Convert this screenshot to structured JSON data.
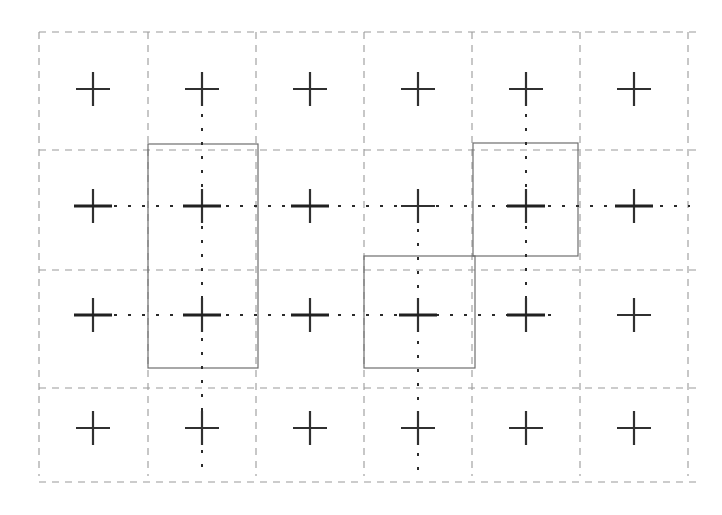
{
  "figure": {
    "title": "",
    "caption": "",
    "width": 722,
    "height": 515,
    "background_color": "#ffffff"
  },
  "chart_data": {
    "type": "scatter",
    "title": "",
    "subtitle": "",
    "xlabel": "",
    "ylabel": "",
    "xlim": [
      0,
      722
    ],
    "ylim": [
      0,
      515
    ],
    "grid": true,
    "legend": null,
    "colors": {
      "cross": "#303030",
      "dashed_grid": "#9a9a9a",
      "solid_rect": "#6e6e6e",
      "dotted_line": "#2b2b2b",
      "background": "#ffffff"
    },
    "grid_columns": 6,
    "grid_rows": 4,
    "dashed_grid": {
      "stroke": "#9a9a9a",
      "stroke_width": 1.1,
      "dash_pattern": "7 6",
      "vertical_x": [
        39,
        148,
        256,
        364,
        472,
        580,
        688
      ],
      "vertical_y_range": [
        32,
        476
      ],
      "horizontal_y": [
        32,
        150,
        270,
        388,
        482
      ],
      "horizontal_x_range": [
        39,
        696
      ]
    },
    "cross_markers": {
      "stroke": "#303030",
      "stroke_width": 2.2,
      "arm_half_length": 17,
      "columns_x": [
        93,
        202,
        310,
        418,
        526,
        634
      ],
      "rows_y": [
        89,
        206,
        315,
        428
      ],
      "points": [
        {
          "id": "c1r1",
          "x": 93,
          "y": 89
        },
        {
          "id": "c2r1",
          "x": 202,
          "y": 89
        },
        {
          "id": "c3r1",
          "x": 310,
          "y": 89
        },
        {
          "id": "c4r1",
          "x": 418,
          "y": 89
        },
        {
          "id": "c5r1",
          "x": 526,
          "y": 89
        },
        {
          "id": "c6r1",
          "x": 634,
          "y": 89
        },
        {
          "id": "c1r2",
          "x": 93,
          "y": 206
        },
        {
          "id": "c2r2",
          "x": 202,
          "y": 206
        },
        {
          "id": "c3r2",
          "x": 310,
          "y": 206
        },
        {
          "id": "c4r2",
          "x": 418,
          "y": 206
        },
        {
          "id": "c5r2",
          "x": 526,
          "y": 206
        },
        {
          "id": "c6r2",
          "x": 634,
          "y": 206
        },
        {
          "id": "c1r3",
          "x": 93,
          "y": 315
        },
        {
          "id": "c2r3",
          "x": 202,
          "y": 315
        },
        {
          "id": "c3r3",
          "x": 310,
          "y": 315
        },
        {
          "id": "c4r3",
          "x": 418,
          "y": 315
        },
        {
          "id": "c5r3",
          "x": 526,
          "y": 315
        },
        {
          "id": "c6r3",
          "x": 634,
          "y": 315
        },
        {
          "id": "c1r4",
          "x": 93,
          "y": 428
        },
        {
          "id": "c2r4",
          "x": 202,
          "y": 428
        },
        {
          "id": "c3r4",
          "x": 310,
          "y": 428
        },
        {
          "id": "c4r4",
          "x": 418,
          "y": 428
        },
        {
          "id": "c5r4",
          "x": 526,
          "y": 428
        },
        {
          "id": "c6r4",
          "x": 634,
          "y": 428
        }
      ]
    },
    "solid_rectangles": {
      "stroke": "#6e6e6e",
      "stroke_width": 1.2,
      "fill": "none",
      "items": [
        {
          "id": "rect-left",
          "x": 148,
          "y": 144,
          "width": 110,
          "height": 224
        },
        {
          "id": "rect-upper-right",
          "x": 473,
          "y": 143,
          "width": 105,
          "height": 113
        },
        {
          "id": "rect-lower-middle",
          "x": 364,
          "y": 256,
          "width": 111,
          "height": 112
        }
      ]
    },
    "dotted_lines": {
      "stroke": "#2b2b2b",
      "stroke_width": 2.0,
      "dash_pattern": "3 11",
      "vertical": [
        {
          "id": "dotted-v-col2",
          "x": 202,
          "y1": 100,
          "y2": 470
        },
        {
          "id": "dotted-v-col4",
          "x": 418,
          "y1": 215,
          "y2": 470
        },
        {
          "id": "dotted-v-col5",
          "x": 526,
          "y1": 100,
          "y2": 330
        }
      ],
      "horizontal": [
        {
          "id": "dotted-h-row2",
          "y": 206,
          "x1": 100,
          "x2": 690
        },
        {
          "id": "dotted-h-row3",
          "y": 315,
          "x1": 100,
          "x2": 560
        }
      ]
    },
    "tick_marks": {
      "stroke": "#202020",
      "stroke_width": 3.0,
      "half_length": 19,
      "items": [
        {
          "id": "tick-c2r2",
          "x": 202,
          "y": 206,
          "orientation": "horizontal"
        },
        {
          "id": "tick-c3r2",
          "x": 310,
          "y": 206,
          "orientation": "horizontal"
        },
        {
          "id": "tick-c5r2",
          "x": 526,
          "y": 206,
          "orientation": "horizontal"
        },
        {
          "id": "tick-c6r2",
          "x": 634,
          "y": 206,
          "orientation": "horizontal"
        },
        {
          "id": "tick-c1r2",
          "x": 93,
          "y": 206,
          "orientation": "horizontal"
        },
        {
          "id": "tick-c1r3",
          "x": 93,
          "y": 315,
          "orientation": "horizontal"
        },
        {
          "id": "tick-c2r3",
          "x": 202,
          "y": 315,
          "orientation": "horizontal"
        },
        {
          "id": "tick-c3r3",
          "x": 310,
          "y": 315,
          "orientation": "horizontal"
        },
        {
          "id": "tick-c4r3",
          "x": 418,
          "y": 315,
          "orientation": "horizontal"
        },
        {
          "id": "tick-c5r3",
          "x": 526,
          "y": 315,
          "orientation": "horizontal"
        }
      ]
    }
  }
}
